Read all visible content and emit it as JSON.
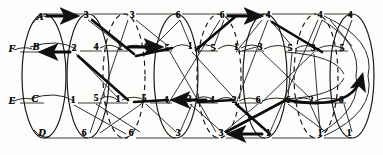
{
  "diagram": {
    "ink_color": "#111111",
    "paper_color": "#fdfdfc",
    "stages": [
      {
        "name": "stage-1",
        "style": "solid",
        "cx": 44,
        "rx": 26,
        "nodes": [
          {
            "label": "A",
            "x": 40,
            "y": 17,
            "kind": "alpha"
          },
          {
            "label": "F",
            "x": 12,
            "y": 49,
            "kind": "alpha"
          },
          {
            "label": "B",
            "x": 36,
            "y": 47,
            "kind": "alpha"
          },
          {
            "label": "E",
            "x": 12,
            "y": 101,
            "kind": "alpha"
          },
          {
            "label": "C",
            "x": 35,
            "y": 99,
            "kind": "alpha"
          },
          {
            "label": "D",
            "x": 42,
            "y": 133,
            "kind": "alpha"
          }
        ]
      },
      {
        "name": "stage-2",
        "style": "solid",
        "cx": 88,
        "rx": 24,
        "nodes": [
          {
            "label": "3",
            "x": 86,
            "y": 16,
            "kind": "num"
          },
          {
            "label": "2",
            "x": 74,
            "y": 49,
            "kind": "num"
          },
          {
            "label": "1",
            "x": 73,
            "y": 101,
            "kind": "num"
          },
          {
            "label": "6",
            "x": 84,
            "y": 134,
            "kind": "num"
          }
        ]
      },
      {
        "name": "stage-3",
        "style": "dashed",
        "cx": 124,
        "rx": 24,
        "nodes": [
          {
            "label": "3",
            "x": 132,
            "y": 16,
            "kind": "num"
          },
          {
            "label": "4",
            "x": 96,
            "y": 48,
            "kind": "num"
          },
          {
            "label": "2",
            "x": 120,
            "y": 48,
            "kind": "num"
          },
          {
            "label": "5",
            "x": 96,
            "y": 99,
            "kind": "num"
          },
          {
            "label": "1",
            "x": 118,
            "y": 100,
            "kind": "num"
          },
          {
            "label": "6",
            "x": 131,
            "y": 134,
            "kind": "num"
          }
        ]
      },
      {
        "name": "stage-4",
        "style": "solid",
        "cx": 176,
        "rx": 25,
        "nodes": [
          {
            "label": "6",
            "x": 178,
            "y": 16,
            "kind": "num"
          },
          {
            "label": "4",
            "x": 145,
            "y": 48,
            "kind": "num"
          },
          {
            "label": "5",
            "x": 167,
            "y": 49,
            "kind": "num"
          },
          {
            "label": "5",
            "x": 144,
            "y": 99,
            "kind": "num"
          },
          {
            "label": "4",
            "x": 166,
            "y": 101,
            "kind": "num"
          },
          {
            "label": "3",
            "x": 178,
            "y": 134,
            "kind": "num"
          }
        ]
      },
      {
        "name": "stage-5",
        "style": "dashed",
        "cx": 219,
        "rx": 25,
        "nodes": [
          {
            "label": "6",
            "x": 222,
            "y": 16,
            "kind": "num"
          },
          {
            "label": "1",
            "x": 190,
            "y": 47,
            "kind": "num"
          },
          {
            "label": "5",
            "x": 213,
            "y": 49,
            "kind": "num"
          },
          {
            "label": "2",
            "x": 189,
            "y": 100,
            "kind": "num"
          },
          {
            "label": "4",
            "x": 212,
            "y": 101,
            "kind": "num"
          },
          {
            "label": "3",
            "x": 221,
            "y": 134,
            "kind": "num"
          }
        ]
      },
      {
        "name": "stage-6",
        "style": "solid",
        "cx": 265,
        "rx": 25,
        "nodes": [
          {
            "label": "4",
            "x": 268,
            "y": 16,
            "kind": "num"
          },
          {
            "label": "1",
            "x": 236,
            "y": 48,
            "kind": "num"
          },
          {
            "label": "3",
            "x": 260,
            "y": 48,
            "kind": "num"
          },
          {
            "label": "2",
            "x": 234,
            "y": 101,
            "kind": "num"
          },
          {
            "label": "6",
            "x": 258,
            "y": 101,
            "kind": "num"
          },
          {
            "label": "1",
            "x": 268,
            "y": 134,
            "kind": "num"
          }
        ]
      },
      {
        "name": "stage-7",
        "style": "dashed",
        "cx": 318,
        "rx": 26,
        "nodes": [
          {
            "label": "4",
            "x": 320,
            "y": 16,
            "kind": "num"
          },
          {
            "label": "5",
            "x": 290,
            "y": 49,
            "kind": "num"
          },
          {
            "label": "3",
            "x": 313,
            "y": 49,
            "kind": "num"
          },
          {
            "label": "6",
            "x": 288,
            "y": 101,
            "kind": "num"
          },
          {
            "label": "2",
            "x": 311,
            "y": 101,
            "kind": "num"
          },
          {
            "label": "1",
            "x": 320,
            "y": 134,
            "kind": "num"
          }
        ]
      },
      {
        "name": "stage-8",
        "style": "solid",
        "cx": 352,
        "rx": 24,
        "nodes": [
          {
            "label": "4",
            "x": 350,
            "y": 16,
            "kind": "num"
          },
          {
            "label": "5",
            "x": 342,
            "y": 49,
            "kind": "num"
          },
          {
            "label": "6",
            "x": 341,
            "y": 101,
            "kind": "num"
          },
          {
            "label": "1",
            "x": 349,
            "y": 134,
            "kind": "num"
          }
        ]
      }
    ],
    "bold_arrows": [
      {
        "name": "arrow-A-to-3",
        "from": [
          47,
          16
        ],
        "to": [
          79,
          16
        ]
      },
      {
        "name": "arrow-2-to-B",
        "from": [
          69,
          52
        ],
        "to": [
          40,
          52
        ]
      },
      {
        "name": "arrow-4-to-5",
        "from": [
          128,
          47
        ],
        "to": [
          162,
          47
        ]
      },
      {
        "name": "arrow-4-to-5b",
        "from": [
          206,
          100
        ],
        "to": [
          172,
          100
        ]
      },
      {
        "name": "arrow-6-to-4",
        "from": [
          228,
          16
        ],
        "to": [
          262,
          16
        ]
      },
      {
        "name": "arrow-1-to-3",
        "from": [
          262,
          134
        ],
        "to": [
          228,
          134
        ]
      },
      {
        "name": "arrow-long-right",
        "from": [
          88,
          16
        ],
        "to": [
          362,
          70
        ]
      }
    ]
  }
}
